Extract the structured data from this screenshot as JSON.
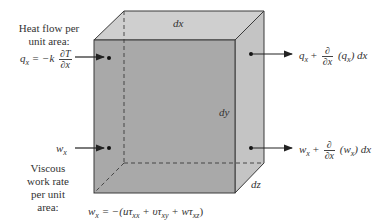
{
  "figure": {
    "type": "control volume energy flux diagram",
    "colors": {
      "front_face": "#a9a9a9",
      "top_face": "#cfcfcf",
      "side_face": "#c2c2c2",
      "edge": "#3a3a3a",
      "arrow": "#222222"
    },
    "dimensions": {
      "dx": "dx",
      "dy": "dy",
      "dz": "dz"
    },
    "left_heat": {
      "caption_line1": "Heat flow per",
      "caption_line2": "unit area:",
      "q": "q",
      "q_sub": "x",
      "eq": "= −k",
      "num": "∂T",
      "den": "∂x"
    },
    "right_heat": {
      "q": "q",
      "q_sub": "x",
      "plus": "+",
      "num": "∂",
      "den": "∂x",
      "paren_open": "(q",
      "paren_sub": "x",
      "paren_close": ") dx"
    },
    "left_work": {
      "w": "w",
      "w_sub": "x",
      "caption_line1": "Viscous",
      "caption_line2": "work rate",
      "caption_line3": "per unit",
      "caption_line4": "area:"
    },
    "right_work": {
      "w": "w",
      "w_sub": "x",
      "plus": "+",
      "num": "∂",
      "den": "∂x",
      "paren_open": "(w",
      "paren_sub": "x",
      "paren_close": ") dx"
    },
    "work_equation": {
      "lhs": "w",
      "lhs_sub": "x",
      "body1": "= −(uτ",
      "sub1": "xx",
      "body2": " + υτ",
      "sub2": "xy",
      "body3": " + wτ",
      "sub3": "xz",
      "close": ")"
    }
  }
}
